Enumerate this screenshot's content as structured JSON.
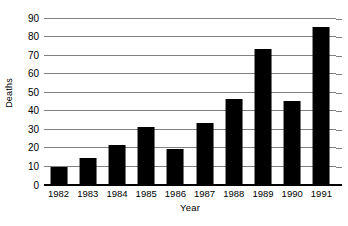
{
  "chart_data": {
    "type": "bar",
    "title": "",
    "subtitle": "",
    "xlabel": "Year",
    "ylabel": "Deaths",
    "categories": [
      "1982",
      "1983",
      "1984",
      "1985",
      "1986",
      "1987",
      "1988",
      "1989",
      "1990",
      "1991"
    ],
    "values": [
      9,
      14,
      21,
      31,
      19,
      33,
      46,
      73,
      45,
      85
    ],
    "series": [
      {
        "name": "Deaths",
        "values": [
          9,
          14,
          21,
          31,
          19,
          33,
          46,
          73,
          45,
          85
        ]
      }
    ],
    "ylim": [
      0,
      90
    ],
    "ytick_labels": [
      "0",
      "10",
      "20",
      "30",
      "40",
      "50",
      "60",
      "70",
      "80",
      "90"
    ],
    "ytick_values": [
      0,
      10,
      20,
      30,
      40,
      50,
      60,
      70,
      80,
      90
    ],
    "ytick_step": 10,
    "grid": true,
    "grid_axis": "y",
    "legend": false,
    "legend_position": "none",
    "bar_color": "#000000",
    "gridline_color": "#808080",
    "axis_color": "#000000",
    "background_color": "#ffffff",
    "annotations": []
  }
}
